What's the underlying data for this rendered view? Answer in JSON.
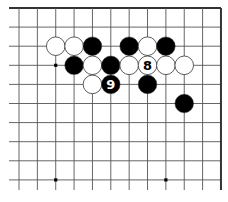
{
  "diagram": {
    "type": "go-board-partial",
    "edges": [
      "top",
      "right"
    ],
    "grid": {
      "columns": 12,
      "rows": 10,
      "x0": 19,
      "dx": 18.36,
      "y0": 8,
      "dy": 19.1,
      "line_left": 9,
      "line_bottom": 190
    },
    "colors": {
      "line": "#555555",
      "edge": "#333333",
      "black_stone": "#000000",
      "white_stone": "#ffffff",
      "stone_outline": "#333333"
    },
    "star_points": [
      {
        "col": 2,
        "row": 3
      },
      {
        "col": 2,
        "row": 9
      },
      {
        "col": 8,
        "row": 9
      }
    ],
    "stones": [
      {
        "color": "white",
        "col": 2,
        "row": 2,
        "label": ""
      },
      {
        "color": "white",
        "col": 3,
        "row": 2,
        "label": ""
      },
      {
        "color": "black",
        "col": 4,
        "row": 2,
        "label": ""
      },
      {
        "color": "black",
        "col": 6,
        "row": 2,
        "label": ""
      },
      {
        "color": "white",
        "col": 7,
        "row": 2,
        "label": ""
      },
      {
        "color": "black",
        "col": 8,
        "row": 2,
        "label": ""
      },
      {
        "color": "black",
        "col": 3,
        "row": 3,
        "label": ""
      },
      {
        "color": "white",
        "col": 4,
        "row": 3,
        "label": ""
      },
      {
        "color": "black",
        "col": 5,
        "row": 3,
        "label": ""
      },
      {
        "color": "white",
        "col": 6,
        "row": 3,
        "label": ""
      },
      {
        "color": "white",
        "col": 7,
        "row": 3,
        "label": "8"
      },
      {
        "color": "white",
        "col": 8,
        "row": 3,
        "label": ""
      },
      {
        "color": "white",
        "col": 9,
        "row": 3,
        "label": ""
      },
      {
        "color": "white",
        "col": 4,
        "row": 4,
        "label": ""
      },
      {
        "color": "black",
        "col": 5,
        "row": 4,
        "label": "9"
      },
      {
        "color": "black",
        "col": 7,
        "row": 4,
        "label": ""
      },
      {
        "color": "black",
        "col": 9,
        "row": 5,
        "label": ""
      }
    ]
  }
}
